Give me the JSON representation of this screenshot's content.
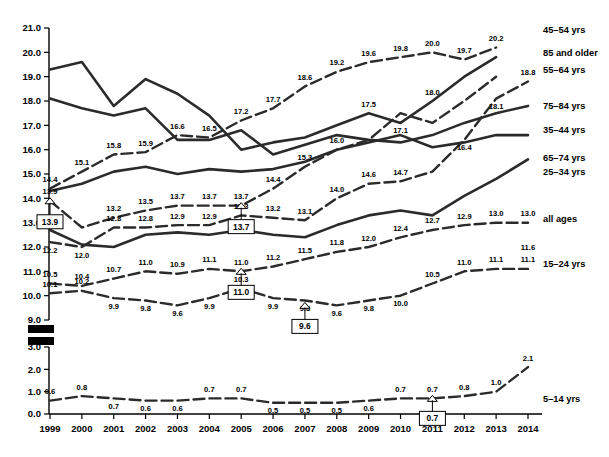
{
  "chart_data": {
    "type": "line",
    "title": "",
    "xlabel": "",
    "ylabel": "",
    "grid": false,
    "legend_position": "right",
    "x": [
      1999,
      2000,
      2001,
      2002,
      2003,
      2004,
      2005,
      2006,
      2007,
      2008,
      2009,
      2010,
      2011,
      2012,
      2013,
      2014
    ],
    "categories": [
      "1999",
      "2000",
      "2001",
      "2002",
      "2003",
      "2004",
      "2005",
      "2006",
      "2007",
      "2008",
      "2009",
      "2010",
      "2011",
      "2012",
      "2013",
      "2014"
    ],
    "ylim_upper": [
      9.0,
      21.0
    ],
    "ylim_lower": [
      0.0,
      3.0
    ],
    "axis_break": true,
    "yticks_upper": [
      "21.0",
      "20.0",
      "19.0",
      "18.0",
      "17.0",
      "16.0",
      "15.0",
      "14.0",
      "13.0",
      "12.0",
      "11.0",
      "10.0",
      "9.0"
    ],
    "yticks_lower": [
      "3.0",
      "2.0",
      "1.0",
      "0.0"
    ],
    "series": [
      {
        "name": "45–54 yrs",
        "style": "dashed",
        "legend": "45–54 yrs",
        "values": [
          14.4,
          15.1,
          15.8,
          15.9,
          16.6,
          16.5,
          17.2,
          17.7,
          18.6,
          19.2,
          19.6,
          19.8,
          20.0,
          19.7,
          20.2,
          null
        ],
        "labels": [
          "14.4",
          "15.1",
          "15.8",
          "15.9",
          "16.6",
          "16.5",
          "17.2",
          "17.7",
          "18.6",
          "19.2",
          "19.6",
          "19.8",
          "20.0",
          "19.7",
          "20.2",
          ""
        ]
      },
      {
        "name": "85 and older",
        "style": "solid",
        "legend": "85 and older",
        "values": [
          19.3,
          19.6,
          17.8,
          18.9,
          18.3,
          17.4,
          16.0,
          16.3,
          16.5,
          17.0,
          17.5,
          17.1,
          18.0,
          19.0,
          19.8,
          null
        ],
        "labels": [
          "",
          "",
          "",
          "",
          "",
          "",
          "",
          "",
          "",
          "",
          "17.5",
          "17.1",
          "18.0",
          "",
          "",
          ""
        ]
      },
      {
        "name": "55–64 yrs",
        "style": "dashed",
        "legend": "55–64 yrs",
        "values": [
          12.2,
          12.0,
          12.8,
          12.8,
          12.9,
          12.9,
          13.3,
          13.2,
          13.1,
          14.0,
          14.6,
          14.7,
          15.1,
          16.4,
          18.1,
          18.8
        ],
        "labels": [
          "12.2",
          "12.0",
          "12.8",
          "12.8",
          "12.9",
          "12.9",
          "13.3",
          "13.2",
          "13.1",
          "14.0",
          "14.6",
          "14.7",
          "",
          "16.4",
          "18.1",
          "18.8"
        ]
      },
      {
        "name": "75–84 yrs",
        "style": "solid",
        "legend": "75–84 yrs",
        "values": [
          18.1,
          17.7,
          17.4,
          17.7,
          16.4,
          16.4,
          16.8,
          15.8,
          16.2,
          16.6,
          16.4,
          16.3,
          16.6,
          17.1,
          17.5,
          17.8
        ],
        "labels": [
          "",
          "",
          "",
          "",
          "",
          "",
          "",
          "",
          "",
          "",
          "",
          "",
          "",
          "",
          "",
          ""
        ]
      },
      {
        "name": "35–44 yrs",
        "style": "solid",
        "legend": "35–44 yrs",
        "values": [
          14.3,
          14.6,
          15.1,
          15.3,
          15.0,
          15.2,
          15.1,
          15.2,
          15.5,
          16.0,
          16.3,
          16.6,
          16.1,
          16.3,
          16.6,
          16.6
        ],
        "labels": [
          "",
          "",
          "",
          "",
          "",
          "",
          "",
          "",
          "",
          "",
          "",
          "",
          "",
          "",
          "",
          ""
        ]
      },
      {
        "name": "65–74 yrs",
        "style": "solid",
        "legend": "65–74 yrs",
        "values": [
          12.7,
          12.1,
          12.0,
          12.5,
          12.6,
          12.5,
          12.7,
          12.5,
          12.4,
          12.9,
          13.3,
          13.5,
          13.3,
          14.1,
          14.8,
          15.6
        ],
        "labels": [
          "12.7",
          "",
          "",
          "",
          "",
          "",
          "",
          "",
          "",
          "",
          "",
          "",
          "",
          "",
          "",
          ""
        ]
      },
      {
        "name": "25–34 yrs",
        "style": "dashed",
        "legend": "25–34 yrs",
        "values": [
          13.9,
          12.8,
          13.2,
          13.5,
          13.7,
          13.7,
          13.7,
          14.4,
          15.3,
          16.0,
          16.4,
          17.5,
          17.1,
          18.0,
          19.0,
          null
        ],
        "labels": [
          "13.9",
          "",
          "13.2",
          "13.5",
          "13.7",
          "13.7",
          "13.7",
          "14.4",
          "15.3",
          "16.0",
          "",
          "",
          "",
          "",
          "",
          ""
        ]
      },
      {
        "name": "all ages",
        "style": "dashed",
        "legend": "all ages",
        "values": [
          10.5,
          10.4,
          10.7,
          11.0,
          10.9,
          11.1,
          11.0,
          11.2,
          11.5,
          11.8,
          12.0,
          12.4,
          12.7,
          12.9,
          13.0,
          13.0
        ],
        "labels": [
          "10.5",
          "10.4",
          "10.7",
          "11.0",
          "10.9",
          "11.1",
          "11.0",
          "11.2",
          "11.5",
          "11.8",
          "12.0",
          "12.4",
          "12.7",
          "12.9",
          "13.0",
          "13.0"
        ]
      },
      {
        "name": "15–24 yrs",
        "style": "dashed",
        "legend": "15–24 yrs",
        "values": [
          10.1,
          10.2,
          9.9,
          9.8,
          9.6,
          9.9,
          10.3,
          9.9,
          9.8,
          9.6,
          9.8,
          10.0,
          10.5,
          11.0,
          11.1,
          11.1
        ],
        "labels": [
          "10.1",
          "10.2",
          "9.9",
          "9.8",
          "9.6",
          "9.9",
          "10.3",
          "9.9",
          "9.8",
          "9.6",
          "9.8",
          "10.0",
          "10.5",
          "11.0",
          "11.1",
          "11.1"
        ]
      },
      {
        "name": "15–24 yrs tail",
        "style": "dashed",
        "legend": "",
        "values": [
          null,
          null,
          null,
          null,
          null,
          null,
          null,
          null,
          null,
          null,
          null,
          null,
          null,
          null,
          null,
          11.6
        ],
        "labels": [
          "",
          "",
          "",
          "",
          "",
          "",
          "",
          "",
          "",
          "",
          "",
          "",
          "",
          "",
          "",
          "11.6"
        ]
      },
      {
        "name": "5–14 yrs",
        "style": "dashed",
        "legend": "5–14 yrs",
        "values": [
          0.6,
          0.8,
          0.7,
          0.6,
          0.6,
          0.7,
          0.7,
          0.5,
          0.5,
          0.5,
          0.6,
          0.7,
          0.7,
          0.8,
          1.0,
          2.1
        ],
        "labels": [
          "0.6",
          "0.8",
          "0.7",
          "0.6",
          "0.6",
          "0.7",
          "0.7",
          "0.5",
          "0.5",
          "0.5",
          "0.6",
          "0.7",
          "0.7",
          "0.8",
          "1.0",
          "2.1"
        ]
      }
    ],
    "callouts": [
      {
        "text": "13.9",
        "year": "1999",
        "series": "25–34 yrs",
        "value": 13.9
      },
      {
        "text": "13.7",
        "year": "2005",
        "series": "25–34 yrs",
        "value": 13.7
      },
      {
        "text": "11.0",
        "year": "2005",
        "series": "all ages",
        "value": 11.0
      },
      {
        "text": "9.6",
        "year": "2007",
        "series": "15–24 yrs",
        "value": 9.6
      },
      {
        "text": "0.7",
        "year": "2011",
        "series": "5–14 yrs",
        "value": 0.7
      }
    ]
  },
  "legend": {
    "items": [
      {
        "label": "45–54 yrs"
      },
      {
        "label": "85 and older"
      },
      {
        "label": "55–64 yrs"
      },
      {
        "label": "75–84 yrs"
      },
      {
        "label": "35–44 yrs"
      },
      {
        "label": "65–74 yrs"
      },
      {
        "label": "25–34 yrs"
      },
      {
        "label": "all ages"
      },
      {
        "label": "15–24 yrs"
      },
      {
        "label": "5–14 yrs"
      }
    ]
  }
}
